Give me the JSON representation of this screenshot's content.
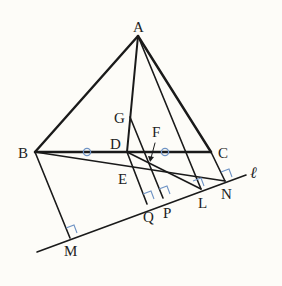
{
  "diagram": {
    "title": "",
    "colors": {
      "line": "#1a1a1a",
      "mark": "#6f93c4",
      "background": "#fdfcf8"
    },
    "points": {
      "A": {
        "label": "A",
        "x": 138,
        "y": 36
      },
      "B": {
        "label": "B",
        "x": 35,
        "y": 152
      },
      "C": {
        "label": "C",
        "x": 211,
        "y": 152
      },
      "D": {
        "label": "D",
        "x": 127,
        "y": 152
      },
      "G": {
        "label": "G",
        "x": 130,
        "y": 117
      },
      "E": {
        "label": "E",
        "x": 133,
        "y": 168
      },
      "F": {
        "label": "F",
        "x": 150,
        "y": 163
      },
      "M": {
        "label": "M",
        "x": 70,
        "y": 237
      },
      "Q": {
        "label": "Q",
        "x": 147,
        "y": 203
      },
      "P": {
        "label": "P",
        "x": 163,
        "y": 198
      },
      "L": {
        "label": "L",
        "x": 201,
        "y": 189
      },
      "N": {
        "label": "N",
        "x": 225,
        "y": 181
      }
    },
    "line_label": "ℓ",
    "equal_marks": "○",
    "right_angle_marks": [
      "M",
      "Q",
      "P",
      "L",
      "N"
    ]
  }
}
